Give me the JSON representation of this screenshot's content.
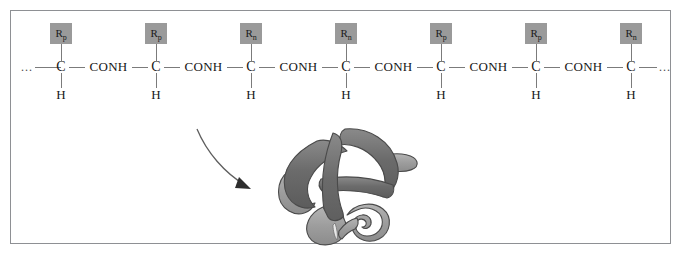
{
  "figure": {
    "type": "polypeptide-chain-folding-diagram",
    "frame_border_color": "#8e9094",
    "background_color": "#ffffff"
  },
  "chain": {
    "left_terminus": "...",
    "right_terminus": "...",
    "linker_label": "CONH",
    "backbone_atom": "C",
    "hydrogen_atom": "H",
    "r_box_color": "#9a9a9a",
    "bond_color": "#7b7b7b",
    "residues": [
      {
        "r_letter": "R",
        "r_subscript": "p",
        "atom": "C",
        "hydrogen": "H"
      },
      {
        "r_letter": "R",
        "r_subscript": "p",
        "atom": "C",
        "hydrogen": "H"
      },
      {
        "r_letter": "R",
        "r_subscript": "n",
        "atom": "C",
        "hydrogen": "H"
      },
      {
        "r_letter": "R",
        "r_subscript": "n",
        "atom": "C",
        "hydrogen": "H"
      },
      {
        "r_letter": "R",
        "r_subscript": "p",
        "atom": "C",
        "hydrogen": "H"
      },
      {
        "r_letter": "R",
        "r_subscript": "p",
        "atom": "C",
        "hydrogen": "H"
      },
      {
        "r_letter": "R",
        "r_subscript": "n",
        "atom": "C",
        "hydrogen": "H"
      }
    ]
  },
  "arrow": {
    "name": "folding-arrow",
    "direction": "down-right",
    "color": "#5e5e5e"
  },
  "protein": {
    "name": "folded-protein-ribbon",
    "ribbon_dark_color": "#6b6b6b",
    "ribbon_light_color": "#9d9d9d",
    "outline_color": "#4a4a4a"
  }
}
